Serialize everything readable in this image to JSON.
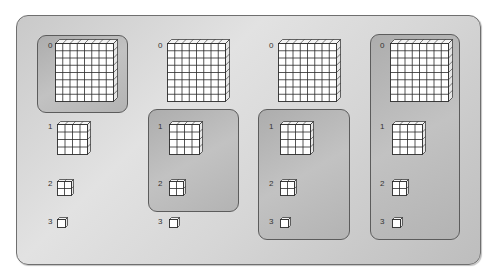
{
  "diagram": {
    "levels": [
      {
        "label": "0",
        "grid": 8,
        "size": 58
      },
      {
        "label": "1",
        "grid": 4,
        "size": 30
      },
      {
        "label": "2",
        "grid": 2,
        "size": 14
      },
      {
        "label": "3",
        "grid": 1,
        "size": 8
      }
    ],
    "columns": [
      {
        "id": "col-1",
        "x": 48,
        "highlight": {
          "from_level": 0,
          "to_level": 0
        }
      },
      {
        "id": "col-2",
        "x": 158,
        "highlight": {
          "from_level": 1,
          "to_level": 2
        }
      },
      {
        "id": "col-3",
        "x": 269,
        "highlight": {
          "from_level": 1,
          "to_level": 3
        }
      },
      {
        "id": "col-4",
        "x": 380,
        "highlight": {
          "from_level": 0,
          "to_level": 3
        }
      }
    ],
    "row_y": [
      43,
      124,
      181,
      219
    ],
    "colors": {
      "panel_border": "#6f6f6f",
      "group_border": "#5c5c5c",
      "grid_line": "#2a2a2a",
      "cell_fill": "#ffffff"
    }
  }
}
